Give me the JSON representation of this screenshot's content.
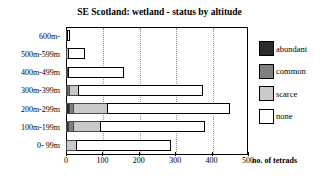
{
  "chart_data": {
    "type": "bar",
    "orientation": "horizontal",
    "stacked": true,
    "title": "SE Scotland: wetland - status by altitude",
    "xlabel": "no. of tetrads",
    "ylabel": "",
    "xlim": [
      0,
      500
    ],
    "xticks": [
      0,
      100,
      200,
      300,
      400,
      500
    ],
    "xtick_labels": [
      "0",
      "100",
      "200",
      "300",
      "400",
      "500"
    ],
    "grid": "vertical-dotted",
    "legend_position": "right",
    "categories": [
      "600m-",
      "500m-599m",
      "400m-499m",
      "300m-399m",
      "200m-299m",
      "100m-199m",
      "0- 99m"
    ],
    "series": [
      {
        "name": "abundant",
        "color": "#2b2b2b",
        "values": [
          0,
          0,
          0,
          6,
          12,
          8,
          0
        ]
      },
      {
        "name": "common",
        "color": "#7f7f7f",
        "values": [
          0,
          0,
          3,
          8,
          14,
          18,
          0
        ]
      },
      {
        "name": "scarce",
        "color": "#c9c9c9",
        "values": [
          2,
          8,
          6,
          28,
          95,
          75,
          30
        ]
      },
      {
        "name": "none",
        "color": "#ffffff",
        "values": [
          10,
          47,
          153,
          343,
          339,
          289,
          260
        ]
      }
    ],
    "totals": [
      12,
      55,
      162,
      385,
      460,
      390,
      290
    ]
  },
  "legend": {
    "entries": [
      {
        "label": "abundant",
        "color": "#2b2b2b"
      },
      {
        "label": "common",
        "color": "#7f7f7f"
      },
      {
        "label": "scarce",
        "color": "#c9c9c9"
      },
      {
        "label": "none",
        "color": "#ffffff"
      }
    ]
  }
}
